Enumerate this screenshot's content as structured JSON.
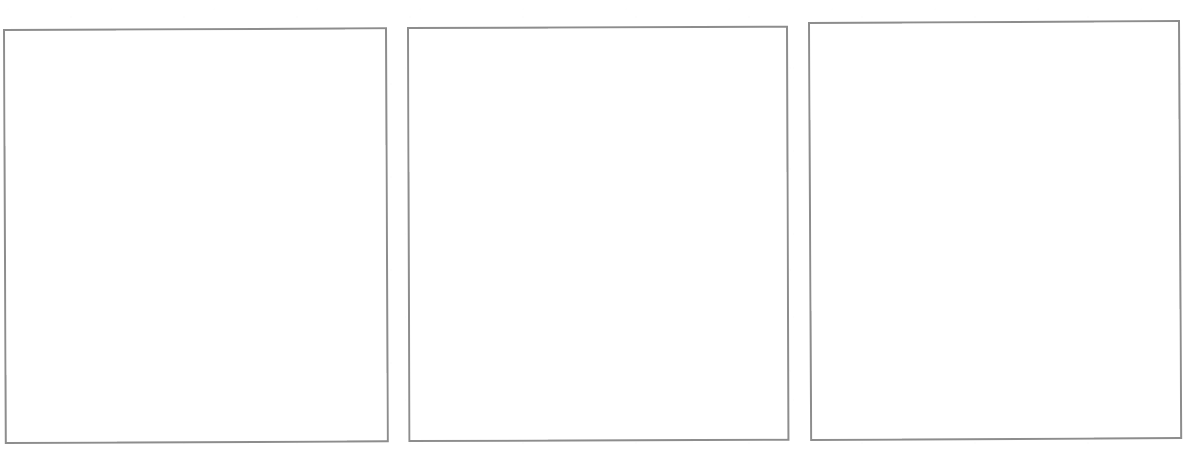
{
  "document": {
    "kind": "scanned-page",
    "page_background": "#ffffff",
    "width": 1193,
    "height": 452,
    "visible_text": "",
    "note_label": ""
  },
  "frames": [
    {
      "id": "frame-1",
      "label": "",
      "content": "",
      "border_color": "#8d8d8d",
      "fill_color": "#ffffff",
      "x": 3,
      "y": 29,
      "width": 384,
      "height": 415,
      "rotation_deg": -0.25
    },
    {
      "id": "frame-2",
      "label": "",
      "content": "",
      "border_color": "#8d8d8d",
      "fill_color": "#ffffff",
      "x": 407,
      "y": 27,
      "width": 381,
      "height": 415,
      "rotation_deg": -0.2
    },
    {
      "id": "frame-3",
      "label": "",
      "content": "",
      "border_color": "#8d8d8d",
      "fill_color": "#ffffff",
      "x": 808,
      "y": 22,
      "width": 372,
      "height": 419,
      "rotation_deg": -0.3
    }
  ]
}
